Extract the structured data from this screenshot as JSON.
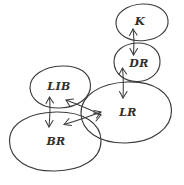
{
  "diagram": {
    "style": "handwritten-sketch",
    "background_color": "#ffffff",
    "stroke_color": "#3b3b3b",
    "nodes": [
      {
        "id": "k",
        "label": "K",
        "shape": "ellipse",
        "cx": 142,
        "cy": 22,
        "rx": 26,
        "ry": 18
      },
      {
        "id": "dr",
        "label": "DR",
        "shape": "ellipse",
        "cx": 137,
        "cy": 62,
        "rx": 23,
        "ry": 19
      },
      {
        "id": "lib",
        "label": "LIB",
        "shape": "ellipse",
        "cx": 60,
        "cy": 87,
        "rx": 30,
        "ry": 21
      },
      {
        "id": "lr",
        "label": "LR",
        "shape": "ellipse",
        "cx": 126,
        "cy": 112,
        "rx": 45,
        "ry": 30
      },
      {
        "id": "br",
        "label": "BR",
        "shape": "ellipse",
        "cx": 55,
        "cy": 141,
        "rx": 46,
        "ry": 29
      }
    ],
    "edges": [
      {
        "id": "k-dr",
        "from": "k",
        "to": "dr",
        "type": "double-arrow",
        "orientation": "vertical"
      },
      {
        "id": "dr-lr",
        "from": "dr",
        "to": "lr",
        "type": "double-arrow",
        "orientation": "vertical"
      },
      {
        "id": "lib-br",
        "from": "lib",
        "to": "br",
        "type": "double-arrow",
        "orientation": "vertical"
      },
      {
        "id": "lib-lr",
        "from": "lib",
        "to": "lr",
        "type": "double-arrow",
        "orientation": "diagonal"
      },
      {
        "id": "br-lr",
        "from": "br",
        "to": "lr",
        "type": "double-arrow",
        "orientation": "diagonal"
      }
    ]
  }
}
